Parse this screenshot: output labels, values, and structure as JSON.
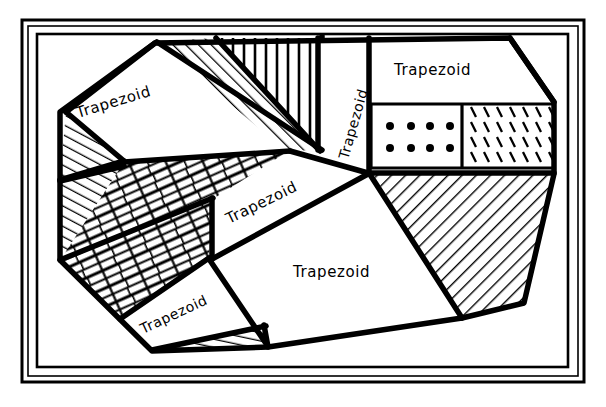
{
  "figure": {
    "background_color": "#ffffff",
    "ink_color": "#000000",
    "frame": {
      "name": "double-line-rectangular-border",
      "outer_rect": {
        "x": 22,
        "y": 20,
        "width": 562,
        "height": 362
      },
      "inner_rect": {
        "x": 28,
        "y": 26,
        "width": 550,
        "height": 350
      },
      "content_rect": {
        "x": 37,
        "y": 34,
        "width": 531,
        "height": 333
      },
      "stroke_outer": 2,
      "stroke_inner": 1,
      "stroke_content": 2
    }
  },
  "labels": [
    {
      "id": "label-top-left",
      "text": "Trapezoid",
      "x": 78,
      "y": 118,
      "rotation": -17,
      "font_size": 15
    },
    {
      "id": "label-vertical",
      "text": "Trapezoid",
      "x": 348,
      "y": 160,
      "rotation": -74,
      "font_size": 14
    },
    {
      "id": "label-top-right",
      "text": "Trapezoid",
      "x": 394,
      "y": 75,
      "rotation": 0,
      "font_size": 15
    },
    {
      "id": "label-center",
      "text": "Trapezoid",
      "x": 229,
      "y": 224,
      "rotation": -26,
      "font_size": 15
    },
    {
      "id": "label-lower-center",
      "text": "Trapezoid",
      "x": 293,
      "y": 277,
      "rotation": 0,
      "font_size": 15
    },
    {
      "id": "label-bottom-left",
      "text": "Trapezoid",
      "x": 143,
      "y": 334,
      "rotation": -25,
      "font_size": 14
    }
  ],
  "regions": [
    {
      "id": "region-top-left-plain",
      "name": "trapezoid-top-left",
      "fill_pattern": "none",
      "label_ref": "label-top-left",
      "points": "66,112 155,43 216,38 123,160"
    },
    {
      "id": "region-left-hatch-upper",
      "name": "hatched-wedge-upper-left",
      "fill_pattern": "diagonal-hatch",
      "label_ref": null,
      "points": "66,112 123,160 60,178"
    },
    {
      "id": "region-diag-hatch-band",
      "name": "hatched-diagonal-band-top",
      "fill_pattern": "diagonal-hatch",
      "label_ref": null,
      "points": "157,42 216,38 318,149 284,150"
    },
    {
      "id": "region-vertical-hatch",
      "name": "vertical-line-triangle",
      "fill_pattern": "vertical-lines",
      "label_ref": null,
      "points": "216,38 318,38 318,149"
    },
    {
      "id": "region-vertical-label",
      "name": "trapezoid-vertical-label",
      "fill_pattern": "none",
      "label_ref": "label-vertical",
      "points": "322,38 368,38 368,172 318,152"
    },
    {
      "id": "region-top-right",
      "name": "trapezoid-top-right",
      "fill_pattern": "none",
      "label_ref": "label-top-right",
      "points": "372,38 510,38 553,102 372,102"
    },
    {
      "id": "region-dots",
      "name": "dotted-rectangle",
      "fill_pattern": "dots",
      "label_ref": null,
      "points": "372,106 460,106 460,166 372,166"
    },
    {
      "id": "region-ticks",
      "name": "tick-mark-rectangle",
      "fill_pattern": "tick-marks",
      "label_ref": null,
      "points": "464,106 554,106 554,166 464,166"
    },
    {
      "id": "region-right-hatch",
      "name": "hatched-right-wedge",
      "fill_pattern": "diagonal-hatch",
      "label_ref": null,
      "points": "372,172 554,172 524,303 462,318"
    },
    {
      "id": "region-brick",
      "name": "brick-pattern-band",
      "fill_pattern": "brick",
      "label_ref": null,
      "points": "123,162 287,152 212,200 208,257 120,318 60,260"
    },
    {
      "id": "region-left-hatch-lower",
      "name": "hatched-wedge-lower-left",
      "fill_pattern": "diagonal-hatch",
      "label_ref": null,
      "points": "60,182 123,164 60,258"
    },
    {
      "id": "region-center",
      "name": "trapezoid-center",
      "fill_pattern": "none",
      "label_ref": "label-center",
      "points": "213,198 290,152 366,174 212,256"
    },
    {
      "id": "region-lower-center",
      "name": "trapezoid-lower-center",
      "fill_pattern": "none",
      "label_ref": "label-lower-center",
      "points": "212,260 368,176 460,320 270,348"
    },
    {
      "id": "region-bottom-left",
      "name": "trapezoid-bottom-left",
      "fill_pattern": "none",
      "label_ref": "label-bottom-left",
      "points": "120,320 208,260 266,344 150,350"
    },
    {
      "id": "region-bottom-sliver",
      "name": "hatched-bottom-sliver",
      "fill_pattern": "diagonal-hatch",
      "label_ref": null,
      "points": "152,351 268,347 264,327"
    }
  ],
  "patterns": [
    {
      "id": "diagonal-hatch",
      "name": "diagonal-hatch-pattern",
      "description": "parallel diagonal lines"
    },
    {
      "id": "vertical-lines",
      "name": "vertical-line-pattern",
      "description": "parallel vertical lines"
    },
    {
      "id": "brick",
      "name": "brick-pattern",
      "description": "offset rectangular bricks"
    },
    {
      "id": "dots",
      "name": "dot-grid-pattern",
      "description": "4 columns by 2 rows of filled dots"
    },
    {
      "id": "tick-marks",
      "name": "tick-mark-pattern",
      "description": "rows of short slanted dashes"
    }
  ],
  "dot_grid": {
    "columns": 4,
    "rows": 2,
    "radius": 4,
    "positions": [
      {
        "cx": 390,
        "cy": 126
      },
      {
        "cx": 411,
        "cy": 126
      },
      {
        "cx": 430,
        "cy": 126
      },
      {
        "cx": 450,
        "cy": 126
      },
      {
        "cx": 390,
        "cy": 148
      },
      {
        "cx": 411,
        "cy": 148
      },
      {
        "cx": 430,
        "cy": 148
      },
      {
        "cx": 450,
        "cy": 148
      }
    ]
  }
}
